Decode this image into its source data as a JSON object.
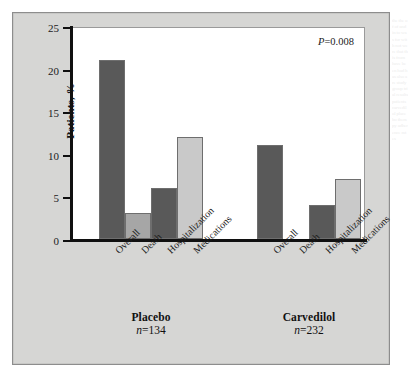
{
  "figure": {
    "p_value_prefix": "P",
    "p_value_text": "=0.008",
    "p_value_full": "P=0.008"
  },
  "axis": {
    "y_title": "Patients, %",
    "y_ticks": [
      "0",
      "5",
      "10",
      "15",
      "20",
      "25"
    ]
  },
  "groups": [
    {
      "name": "Placebo",
      "n_prefix": "n",
      "n_text": "=134",
      "n_full": "n=134"
    },
    {
      "name": "Carvedilol",
      "n_prefix": "n",
      "n_text": "=232",
      "n_full": "n=232"
    }
  ],
  "categories": [
    "Overall",
    "Death",
    "Hospitalization",
    "Medications"
  ],
  "colors": {
    "panel_background": "#d6d6d4",
    "plot_background": "#ffffff",
    "axis": "#101010",
    "bar_dark": "#595959",
    "bar_medium": "#a6a6a6",
    "bar_light": "#c9c9c9",
    "bar_outline": "#6e6e6e"
  },
  "bleed_text": "the the of of and in to was for with not were that this from have been had has also are study group trial results patients carvedilol placebo therapy adherence rates",
  "chart_data": {
    "type": "bar",
    "title": "",
    "subtitle": "",
    "xlabel": "",
    "ylabel": "Patients, %",
    "ylim": [
      0,
      25
    ],
    "ytick_values": [
      0,
      5,
      10,
      15,
      20,
      25
    ],
    "grid": false,
    "legend": false,
    "annotations": [
      "P=0.008"
    ],
    "categories": [
      "Overall",
      "Death",
      "Hospitalization",
      "Medications"
    ],
    "series": [
      {
        "name": "Placebo",
        "n": 134,
        "values": [
          21,
          3,
          6,
          12
        ],
        "colors": [
          "#595959",
          "#a6a6a6",
          "#595959",
          "#c9c9c9"
        ]
      },
      {
        "name": "Carvedilol",
        "n": 232,
        "values": [
          11,
          0,
          4,
          7
        ],
        "colors": [
          "#595959",
          "#a6a6a6",
          "#595959",
          "#c9c9c9"
        ]
      }
    ]
  }
}
